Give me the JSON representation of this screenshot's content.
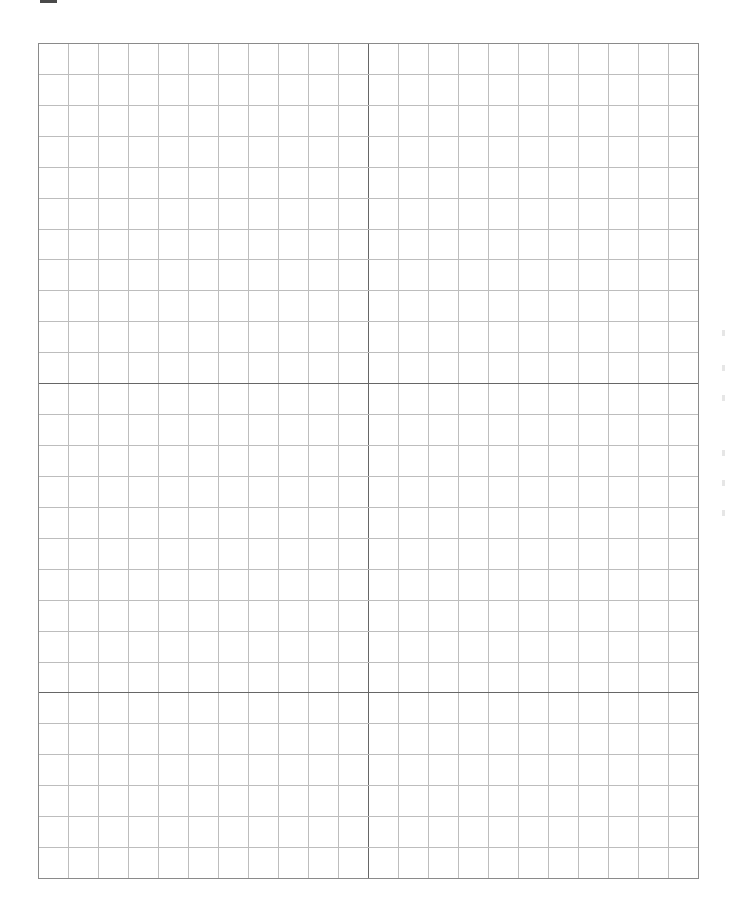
{
  "page": {
    "type": "graph-paper",
    "background": "#ffffff"
  },
  "top_mark": {
    "color": "#4a4a4a"
  },
  "grid": {
    "columns": 22,
    "rows": 27,
    "cell_width_px": 30,
    "cell_height_px": 30.93,
    "major_vertical_line_indices": [
      11
    ],
    "major_horizontal_line_indices": [
      11,
      21
    ],
    "minor_line_color": "#bdbdbd",
    "major_line_color": "#666666",
    "border_color": "#8a8a8a"
  }
}
